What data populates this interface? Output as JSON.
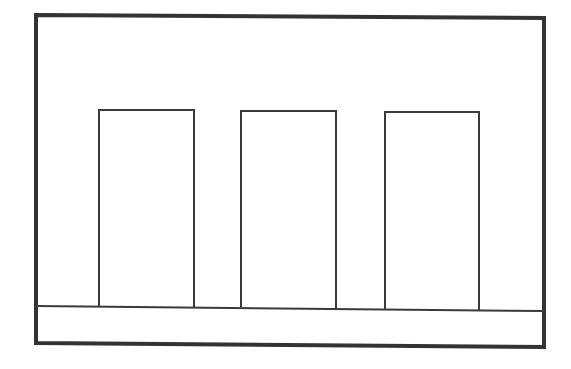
{
  "canvas": {
    "width": 571,
    "height": 369,
    "background": "#ffffff"
  },
  "colors": {
    "frame_stroke": "#333333",
    "line_stroke": "#3a3a3a"
  },
  "frame": {
    "points": "36,15 544,18 544,347 36,343",
    "stroke_width": 4
  },
  "baseline": {
    "x1": 36,
    "y1": 306,
    "x2": 544,
    "y2": 311,
    "stroke_width": 2
  },
  "rectangles": [
    {
      "name": "rect-1",
      "points": "99,306 99,110 194,110 194,307"
    },
    {
      "name": "rect-2",
      "points": "241,307 241,111 336,111 336,309"
    },
    {
      "name": "rect-3",
      "points": "385,309 385,112 479,112 479,310"
    }
  ],
  "rect_stroke_width": 2
}
